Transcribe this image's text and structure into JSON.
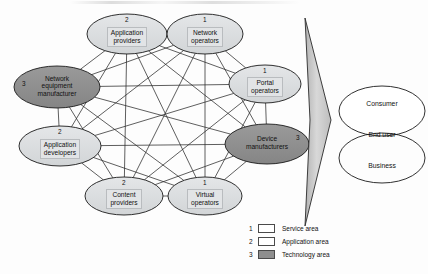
{
  "diagram": {
    "nodes": [
      {
        "id": "application-providers",
        "num": "2",
        "lines": [
          "Application",
          "providers"
        ],
        "fill": "light",
        "cx": 127,
        "cy": 34,
        "rx": 40,
        "ry": 20,
        "num_pos": "top",
        "boxed": true
      },
      {
        "id": "network-operators",
        "num": "1",
        "lines": [
          "Network",
          "operators"
        ],
        "fill": "light",
        "cx": 205,
        "cy": 34,
        "rx": 38,
        "ry": 20,
        "num_pos": "top",
        "boxed": true
      },
      {
        "id": "portal-operators",
        "num": "1",
        "lines": [
          "Portal",
          "operators"
        ],
        "fill": "light",
        "cx": 265,
        "cy": 84,
        "rx": 36,
        "ry": 19,
        "num_pos": "top",
        "boxed": true
      },
      {
        "id": "device-manufacturers",
        "num": "3",
        "lines": [
          "Device",
          "manufacturers"
        ],
        "fill": "dark",
        "cx": 267,
        "cy": 144,
        "rx": 42,
        "ry": 20,
        "num_pos": "right",
        "boxed": false
      },
      {
        "id": "virtual-operators",
        "num": "1",
        "lines": [
          "Virtual",
          "operators"
        ],
        "fill": "light",
        "cx": 205,
        "cy": 196,
        "rx": 37,
        "ry": 19,
        "num_pos": "top",
        "boxed": true
      },
      {
        "id": "content-providers",
        "num": "2",
        "lines": [
          "Content",
          "providers"
        ],
        "fill": "light",
        "cx": 124,
        "cy": 196,
        "rx": 39,
        "ry": 19,
        "num_pos": "top",
        "boxed": true
      },
      {
        "id": "application-developers",
        "num": "2",
        "lines": [
          "Application",
          "developers"
        ],
        "fill": "light",
        "cx": 60,
        "cy": 146,
        "rx": 41,
        "ry": 20,
        "num_pos": "top",
        "boxed": true
      },
      {
        "id": "network-equipment-manufacturer",
        "num": "3",
        "lines": [
          "Network",
          "equipment",
          "manufacturer"
        ],
        "fill": "dark",
        "cx": 57,
        "cy": 87,
        "rx": 43,
        "ry": 21,
        "num_pos": "left",
        "boxed": false
      }
    ],
    "edges": [
      [
        "application-providers",
        "network-operators"
      ],
      [
        "application-providers",
        "portal-operators"
      ],
      [
        "application-providers",
        "device-manufacturers"
      ],
      [
        "application-providers",
        "virtual-operators"
      ],
      [
        "application-providers",
        "content-providers"
      ],
      [
        "application-providers",
        "application-developers"
      ],
      [
        "application-providers",
        "network-equipment-manufacturer"
      ],
      [
        "network-operators",
        "portal-operators"
      ],
      [
        "network-operators",
        "device-manufacturers"
      ],
      [
        "network-operators",
        "virtual-operators"
      ],
      [
        "network-operators",
        "content-providers"
      ],
      [
        "network-operators",
        "application-developers"
      ],
      [
        "network-operators",
        "network-equipment-manufacturer"
      ],
      [
        "portal-operators",
        "device-manufacturers"
      ],
      [
        "portal-operators",
        "virtual-operators"
      ],
      [
        "portal-operators",
        "content-providers"
      ],
      [
        "portal-operators",
        "application-developers"
      ],
      [
        "portal-operators",
        "network-equipment-manufacturer"
      ],
      [
        "device-manufacturers",
        "virtual-operators"
      ],
      [
        "device-manufacturers",
        "content-providers"
      ],
      [
        "device-manufacturers",
        "application-developers"
      ],
      [
        "device-manufacturers",
        "network-equipment-manufacturer"
      ],
      [
        "virtual-operators",
        "content-providers"
      ],
      [
        "virtual-operators",
        "application-developers"
      ],
      [
        "virtual-operators",
        "network-equipment-manufacturer"
      ],
      [
        "content-providers",
        "application-developers"
      ],
      [
        "content-providers",
        "network-equipment-manufacturer"
      ],
      [
        "application-developers",
        "network-equipment-manufacturer"
      ]
    ],
    "arrow": {
      "label": "flow-arrow",
      "points": "305,18 331,120 305,226 310,120"
    },
    "audience": {
      "consumer": "Consumer",
      "end_user": "End user",
      "business": "Business"
    },
    "legend": [
      {
        "num": "1",
        "label": "Service area",
        "swatch": "white"
      },
      {
        "num": "2",
        "label": "Application area",
        "swatch": "white"
      },
      {
        "num": "3",
        "label": "Technology area",
        "swatch": "dark"
      }
    ],
    "colors": {
      "node_light_fill": "#d9dbdd",
      "node_dark_fill": "#8d8d8d",
      "node_stroke": "#1a1a1a",
      "edge_stroke": "#2a2a2a",
      "text_box_fill": "#e2e4e6",
      "arrow_fill": "#c9c9c9",
      "audience_fill": "#ffffff"
    }
  }
}
